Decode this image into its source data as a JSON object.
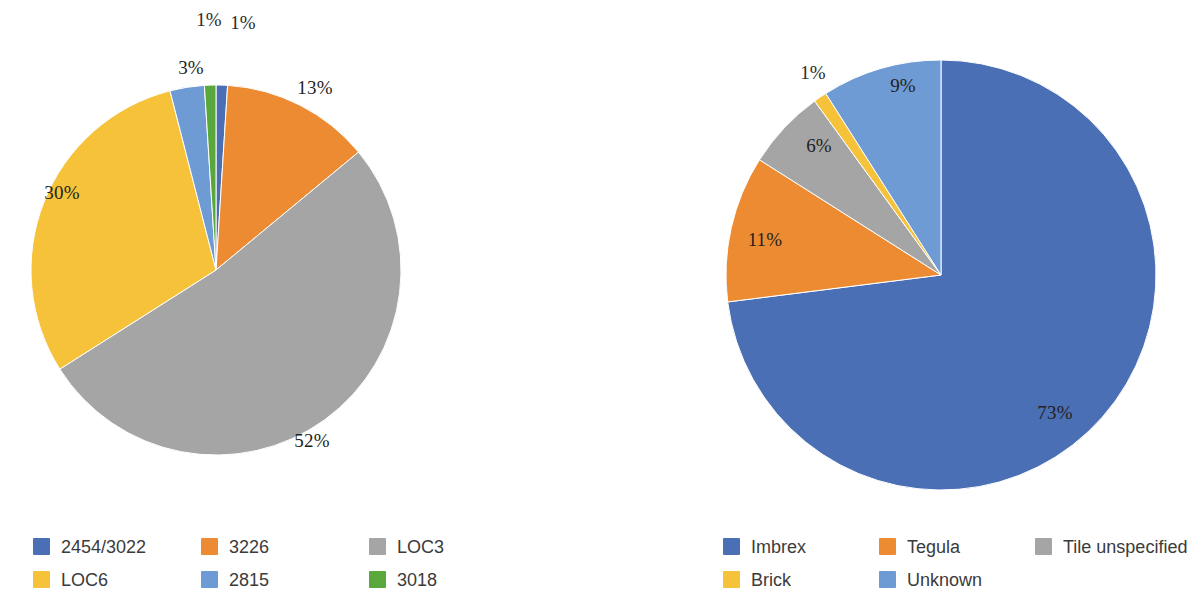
{
  "figure": {
    "background": "#ffffff",
    "label_suffix": "%"
  },
  "palette": {
    "dark_blue": "#4a6fb5",
    "orange": "#ed8b32",
    "gray": "#a5a5a5",
    "yellow": "#f5c23a",
    "light_blue": "#6e9bd4",
    "green": "#5aa83c"
  },
  "chart_data": [
    {
      "type": "pie",
      "id": "left-pie",
      "title": "",
      "start_angle_deg": 0,
      "direction": "clockwise",
      "center": {
        "x": 216,
        "y": 270
      },
      "radius": 185,
      "labels": [
        "2454/3022",
        "3226",
        "LOC3",
        "LOC6",
        "2815",
        "3018"
      ],
      "values": [
        1,
        13,
        52,
        30,
        3,
        1
      ],
      "display_labels": [
        "1%",
        "13%",
        "52%",
        "30%",
        "3%",
        "1%"
      ],
      "colors": [
        "#4a6fb5",
        "#ed8b32",
        "#a5a5a5",
        "#f5c23a",
        "#6e9bd4",
        "#5aa83c"
      ],
      "slice_order_clockwise_from_12": [
        "2454/3022",
        "3226",
        "LOC3",
        "LOC6",
        "2815",
        "3018"
      ],
      "legend": {
        "position": "bottom",
        "columns": 3,
        "entries": [
          {
            "label": "2454/3022",
            "color": "#4a6fb5"
          },
          {
            "label": "3226",
            "color": "#ed8b32"
          },
          {
            "label": "LOC3",
            "color": "#a5a5a5"
          },
          {
            "label": "LOC6",
            "color": "#f5c23a"
          },
          {
            "label": "2815",
            "color": "#6e9bd4"
          },
          {
            "label": "3018",
            "color": "#5aa83c"
          }
        ]
      },
      "label_placement": [
        {
          "text": "1%",
          "x": 243,
          "y": 25,
          "inside": false
        },
        {
          "text": "13%",
          "x": 315,
          "y": 90,
          "inside": true
        },
        {
          "text": "52%",
          "x": 312,
          "y": 443,
          "inside": true
        },
        {
          "text": "30%",
          "x": 62,
          "y": 195,
          "inside": true
        },
        {
          "text": "3%",
          "x": 191,
          "y": 70,
          "inside": true
        },
        {
          "text": "1%",
          "x": 209,
          "y": 22,
          "inside": false
        }
      ]
    },
    {
      "type": "pie",
      "id": "right-pie",
      "title": "",
      "start_angle_deg": 0,
      "direction": "clockwise",
      "center": {
        "x": 338,
        "y": 275
      },
      "radius": 215,
      "labels": [
        "Imbrex",
        "Tegula",
        "Tile unspecified",
        "Brick",
        "Unknown"
      ],
      "values": [
        73,
        11,
        6,
        1,
        9
      ],
      "display_labels": [
        "73%",
        "11%",
        "6%",
        "1%",
        "9%"
      ],
      "colors": [
        "#4a6fb5",
        "#ed8b32",
        "#a5a5a5",
        "#f5c23a",
        "#6e9bd4"
      ],
      "slice_order_clockwise_from_12": [
        "Imbrex",
        "Tegula",
        "Tile unspecified",
        "Brick",
        "Unknown"
      ],
      "legend": {
        "position": "bottom",
        "columns": 3,
        "entries": [
          {
            "label": "Imbrex",
            "color": "#4a6fb5"
          },
          {
            "label": "Tegula",
            "color": "#ed8b32"
          },
          {
            "label": "Tile unspecified",
            "color": "#a5a5a5"
          },
          {
            "label": "Brick",
            "color": "#f5c23a"
          },
          {
            "label": "Unknown",
            "color": "#6e9bd4"
          }
        ]
      },
      "label_placement": [
        {
          "text": "73%",
          "x": 452,
          "y": 415,
          "inside": true
        },
        {
          "text": "11%",
          "x": 162,
          "y": 242,
          "inside": true
        },
        {
          "text": "6%",
          "x": 216,
          "y": 148,
          "inside": true
        },
        {
          "text": "1%",
          "x": 210,
          "y": 75,
          "inside": false
        },
        {
          "text": "9%",
          "x": 300,
          "y": 88,
          "inside": true
        }
      ]
    }
  ]
}
